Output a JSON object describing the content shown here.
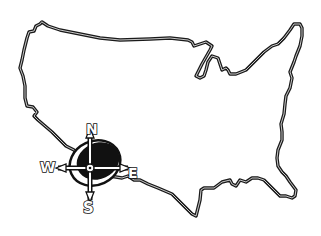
{
  "illustration": {
    "subject": "United States outline map with compass rose",
    "colors": {
      "ink": "#1a1a1a",
      "background": "#ffffff"
    }
  },
  "compass": {
    "north": "N",
    "east": "E",
    "south": "S",
    "west": "W"
  }
}
